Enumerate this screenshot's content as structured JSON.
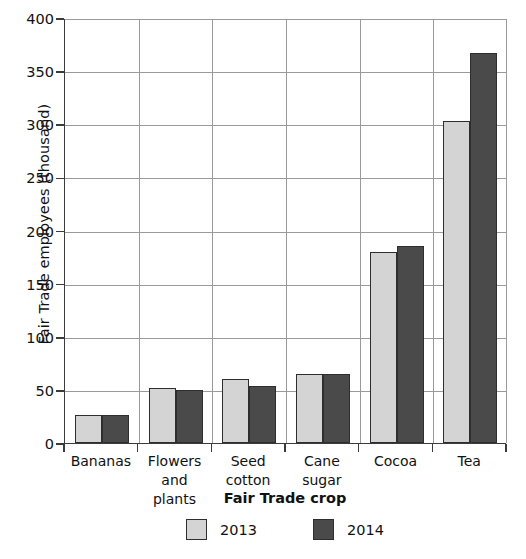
{
  "chart_data": {
    "type": "bar",
    "title": "",
    "xlabel": "Fair Trade crop",
    "ylabel": "Fair Trade employees (thousand)",
    "categories": [
      "Bananas",
      "Flowers and plants",
      "Seed cotton",
      "Cane sugar",
      "Cocoa",
      "Tea"
    ],
    "series": [
      {
        "name": "2013",
        "color": "#d4d4d4",
        "values": [
          26,
          52,
          60,
          65,
          180,
          303
        ]
      },
      {
        "name": "2014",
        "color": "#4a4a4a",
        "values": [
          26,
          50,
          54,
          65,
          185,
          367
        ]
      }
    ],
    "ylim": [
      0,
      400
    ],
    "yticks": [
      0,
      50,
      100,
      150,
      200,
      250,
      300,
      350,
      400
    ],
    "ytick_labels": [
      "0",
      "50",
      "100",
      "150",
      "200",
      "250",
      "300",
      "350",
      "400"
    ],
    "grid": "horizontal-and-vertical",
    "legend_position": "bottom-center"
  },
  "axes": {
    "y_title": "Fair Trade employees (thousand)",
    "x_title": "Fair Trade crop"
  },
  "category_labels": [
    {
      "line1": "Bananas",
      "line2": ""
    },
    {
      "line1": "Flowers",
      "line2": "and plants"
    },
    {
      "line1": "Seed",
      "line2": "cotton"
    },
    {
      "line1": "Cane",
      "line2": "sugar"
    },
    {
      "line1": "Cocoa",
      "line2": ""
    },
    {
      "line1": "Tea",
      "line2": ""
    }
  ],
  "legend": {
    "items": [
      {
        "label": "2013",
        "color": "#d4d4d4"
      },
      {
        "label": "2014",
        "color": "#4a4a4a"
      }
    ]
  },
  "colors": {
    "series_2013": "#d4d4d4",
    "series_2014": "#4a4a4a",
    "axis": "#3b3b3b",
    "grid": "#9a9a9a",
    "bar_outline": "#2e2e2e",
    "text": "#111111",
    "background": "#ffffff"
  }
}
